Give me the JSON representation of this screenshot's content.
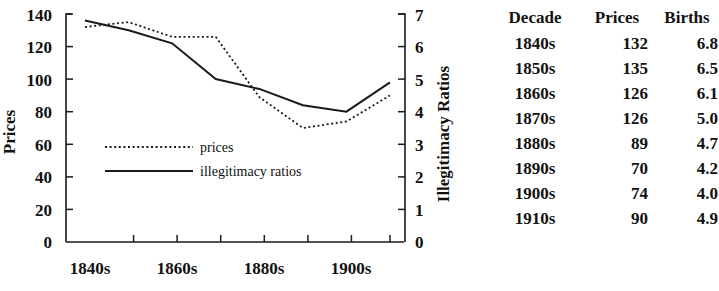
{
  "chart_data": {
    "type": "line",
    "title": "",
    "xlabel": "",
    "categories": [
      "1840s",
      "1850s",
      "1860s",
      "1870s",
      "1880s",
      "1890s",
      "1900s",
      "1910s"
    ],
    "x_tick_labels": [
      "1840s",
      "1860s",
      "1880s",
      "1900s"
    ],
    "grid": false,
    "legend_position": "inside-left-middle",
    "axes": {
      "left": {
        "label": "Prices",
        "ticks": [
          0,
          20,
          40,
          60,
          80,
          100,
          120,
          140
        ],
        "ylim": [
          0,
          140
        ]
      },
      "right": {
        "label": "Illegitimacy Ratios",
        "ticks": [
          0,
          1,
          2,
          3,
          4,
          5,
          6,
          7
        ],
        "ylim": [
          0,
          7
        ]
      }
    },
    "series": [
      {
        "name": "prices",
        "axis": "left",
        "style": "dotted",
        "values": [
          132,
          135,
          126,
          126,
          89,
          70,
          74,
          90
        ]
      },
      {
        "name": "illegitimacy ratios",
        "axis": "right",
        "style": "solid",
        "values": [
          6.8,
          6.5,
          6.1,
          5.0,
          4.7,
          4.2,
          4.0,
          4.9
        ]
      }
    ],
    "legend": [
      {
        "label": "prices",
        "style": "dotted"
      },
      {
        "label": "illegitimacy ratios",
        "style": "solid"
      }
    ]
  },
  "table": {
    "headers": [
      "Decade",
      "Prices",
      "Births"
    ],
    "rows": [
      [
        "1840s",
        "132",
        "6.8"
      ],
      [
        "1850s",
        "135",
        "6.5"
      ],
      [
        "1860s",
        "126",
        "6.1"
      ],
      [
        "1870s",
        "126",
        "5.0"
      ],
      [
        "1880s",
        "89",
        "4.7"
      ],
      [
        "1890s",
        "70",
        "4.2"
      ],
      [
        "1900s",
        "74",
        "4.0"
      ],
      [
        "1910s",
        "90",
        "4.9"
      ]
    ]
  }
}
